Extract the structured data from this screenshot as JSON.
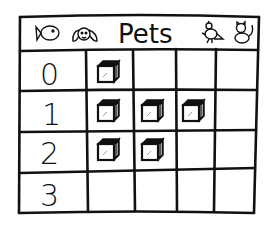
{
  "chart_data": {
    "type": "pictograph",
    "title": "Pets",
    "header_icons": [
      "fish-icon",
      "dog-icon",
      "bird-icon",
      "cat-icon"
    ],
    "categories": [
      "0",
      "1",
      "2",
      "3"
    ],
    "values": [
      1,
      3,
      2,
      0
    ],
    "symbol": "cube-icon",
    "columns_per_row": 4,
    "xlabel": "",
    "ylabel": "",
    "grid": true
  },
  "colors": {
    "ink": "#111111",
    "paper": "#ffffff"
  }
}
